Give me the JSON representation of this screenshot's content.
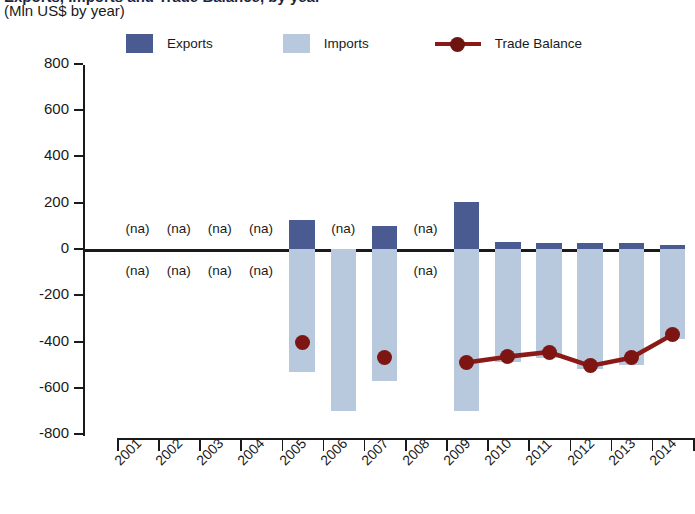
{
  "header": {
    "title": "Exports, Imports and Trade Balance, by year",
    "subtitle": "(Mln US$ by year)"
  },
  "legend": {
    "items": [
      {
        "label": "Exports",
        "type": "swatch",
        "color": "#4a5b91",
        "icon": "exports-swatch"
      },
      {
        "label": "Imports",
        "type": "swatch",
        "color": "#b8c8dd",
        "icon": "imports-swatch"
      },
      {
        "label": "Trade Balance",
        "type": "line",
        "color": "#8b1a16",
        "icon": "trade-balance-line-marker"
      }
    ]
  },
  "colors": {
    "exports": "#4a5b91",
    "imports": "#b8c8dd",
    "trade_balance": "#8b1a16",
    "axis": "#1a1a1a"
  },
  "chart_data": {
    "type": "bar",
    "title": "Exports, Imports and Trade Balance, by year",
    "subtitle": "(Mln US$ by year)",
    "xlabel": "",
    "ylabel": "Mln US$",
    "ylim": [
      -800,
      800
    ],
    "ytick_step": 200,
    "ytick_labels": [
      "800",
      "600",
      "400",
      "200",
      "0",
      "-200",
      "-400",
      "-600",
      "-800"
    ],
    "ytick_values": [
      800,
      600,
      400,
      200,
      0,
      -200,
      -400,
      -600,
      -800
    ],
    "grid": false,
    "legend_position": "top",
    "categories": [
      "2001",
      "2002",
      "2003",
      "2004",
      "2005",
      "2006",
      "2007",
      "2008",
      "2009",
      "2010",
      "2011",
      "2012",
      "2013",
      "2014"
    ],
    "na_label": "(na)",
    "series": [
      {
        "name": "Exports",
        "type": "bar",
        "color": "#4a5b91",
        "values": [
          null,
          null,
          null,
          null,
          125,
          null,
          100,
          null,
          205,
          30,
          25,
          25,
          28,
          18
        ]
      },
      {
        "name": "Imports",
        "type": "bar",
        "color": "#b8c8dd",
        "values": [
          null,
          null,
          null,
          null,
          -530,
          -700,
          -570,
          null,
          -700,
          -490,
          -470,
          -520,
          -500,
          -390
        ]
      },
      {
        "name": "Trade Balance",
        "type": "line",
        "color": "#8b1a16",
        "values": [
          null,
          null,
          null,
          null,
          -405,
          null,
          -470,
          null,
          -490,
          -465,
          -445,
          -505,
          -470,
          -370
        ]
      }
    ]
  }
}
